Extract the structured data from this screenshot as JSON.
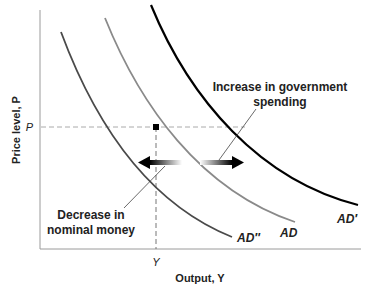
{
  "diagram": {
    "type": "aggregate-demand-shift",
    "y_axis_label": "Price level, P",
    "x_axis_label": "Output, Y",
    "p_tick": "P",
    "y_tick": "Y",
    "curves": [
      {
        "name": "AD''",
        "label": "AD″",
        "color": "#4a4a4a"
      },
      {
        "name": "AD",
        "label": "AD",
        "color": "#8a8a8a"
      },
      {
        "name": "AD'",
        "label": "AD′",
        "color": "#000000"
      }
    ],
    "annotations": {
      "increase_line1": "Increase in government",
      "increase_line2": "spending",
      "decrease_line1": "Decrease in",
      "decrease_line2": "nominal money"
    },
    "equilibrium_point": {
      "label": "(Y, P)",
      "color": "#000000"
    }
  }
}
